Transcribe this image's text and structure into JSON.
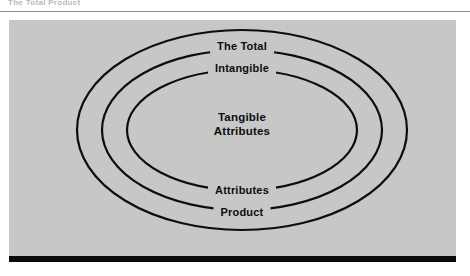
{
  "figure": {
    "caption": "The Total Product",
    "panel_color": "#c7c7c7",
    "line_color": "#0d0d0d",
    "text_color": "#0d0d0d"
  },
  "diagram": {
    "type": "concentric-ellipses",
    "rings": [
      {
        "id": "outer",
        "top_label": "The Total",
        "bottom_label": "Product",
        "rx": 165,
        "ry": 100
      },
      {
        "id": "middle",
        "top_label": "Intangible",
        "bottom_label": "Attributes",
        "rx": 140,
        "ry": 80
      },
      {
        "id": "inner",
        "top_label": "",
        "bottom_label": "",
        "rx": 115,
        "ry": 60
      }
    ],
    "center_label_line1": "Tangible",
    "center_label_line2": "Attributes"
  }
}
